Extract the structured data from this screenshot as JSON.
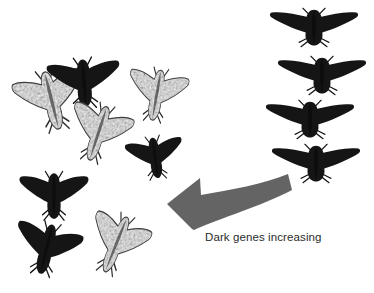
{
  "figure": {
    "background_color": "#ffffff",
    "width": 374,
    "height": 293,
    "caption": "Dark genes increasing",
    "caption_color": "#2b2b2b"
  },
  "arrow": {
    "name": "dark-genes-increasing-arrow",
    "color": "#646464",
    "direction": "left",
    "style": "curved-sweep",
    "label": "Dark genes increasing"
  },
  "palette": {
    "dark_moth": "#151515",
    "dark_moth_shade": "#0c0c0c",
    "speckled_base": "#cfcfcf",
    "speckled_fleck": "#2a2a2a",
    "arrow_gray": "#646464",
    "text": "#2b2b2b"
  },
  "moth_groups": [
    {
      "group": "mixed-population-cluster",
      "position": "left",
      "description": "Mixed cluster of speckled (typica) and dark (melanic) peppered moths",
      "moths": [
        {
          "id": "moth-left-1",
          "form": "speckled",
          "x": 14,
          "y": 62,
          "w": 74,
          "h": 72,
          "rotate": -14,
          "scale": 1.0
        },
        {
          "id": "moth-left-2",
          "form": "dark",
          "x": 46,
          "y": 52,
          "w": 76,
          "h": 58,
          "rotate": -4,
          "scale": 1.0
        },
        {
          "id": "moth-left-3",
          "form": "speckled",
          "x": 126,
          "y": 62,
          "w": 62,
          "h": 62,
          "rotate": 10,
          "scale": 1.0
        },
        {
          "id": "moth-left-4",
          "form": "speckled",
          "x": 66,
          "y": 96,
          "w": 66,
          "h": 70,
          "rotate": 18,
          "scale": 0.98
        },
        {
          "id": "moth-left-5",
          "form": "dark",
          "x": 124,
          "y": 130,
          "w": 62,
          "h": 52,
          "rotate": -8,
          "scale": 0.96
        },
        {
          "id": "moth-left-6",
          "form": "dark",
          "x": 18,
          "y": 166,
          "w": 72,
          "h": 56,
          "rotate": 0,
          "scale": 1.0
        },
        {
          "id": "moth-left-7",
          "form": "dark",
          "x": 12,
          "y": 216,
          "w": 70,
          "h": 62,
          "rotate": 14,
          "scale": 1.0
        },
        {
          "id": "moth-left-8",
          "form": "speckled",
          "x": 86,
          "y": 206,
          "w": 62,
          "h": 72,
          "rotate": 22,
          "scale": 1.0
        }
      ]
    },
    {
      "group": "melanic-column",
      "position": "right",
      "description": "Column of four fully dark melanic moths",
      "moths": [
        {
          "id": "moth-right-1",
          "form": "dark",
          "x": 268,
          "y": 4,
          "w": 92,
          "h": 44,
          "rotate": 0,
          "scale": 1.0
        },
        {
          "id": "moth-right-2",
          "form": "dark",
          "x": 276,
          "y": 52,
          "w": 92,
          "h": 44,
          "rotate": 0,
          "scale": 1.0
        },
        {
          "id": "moth-right-3",
          "form": "dark",
          "x": 264,
          "y": 96,
          "w": 92,
          "h": 44,
          "rotate": 0,
          "scale": 1.0
        },
        {
          "id": "moth-right-4",
          "form": "dark",
          "x": 270,
          "y": 140,
          "w": 92,
          "h": 44,
          "rotate": 0,
          "scale": 1.0
        }
      ]
    }
  ]
}
